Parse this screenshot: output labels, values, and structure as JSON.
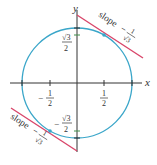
{
  "diagram": {
    "type": "unit circle with tangent lines",
    "axes": {
      "x_label": "x",
      "y_label": "y"
    },
    "ticks": {
      "x_neg": {
        "sign": "−",
        "num": "1",
        "den": "2"
      },
      "x_pos": {
        "num": "1",
        "den": "2"
      },
      "y_pos": {
        "num": "√3",
        "den": "2"
      },
      "y_neg": {
        "sign": "−",
        "num": "√3",
        "den": "2"
      }
    },
    "tangents": [
      {
        "label_word": "slope",
        "label_sign": "−",
        "label_num": "1",
        "label_den": "√3",
        "point": "(1/2, √3/2)"
      },
      {
        "label_word": "slope",
        "label_sign": "−",
        "label_num": "1",
        "label_den": "√3",
        "point": "(−1/2, −√3/2)"
      }
    ],
    "colors": {
      "circle": "#3aa6c9",
      "tangent": "#d9466a",
      "axis": "#333333",
      "tick_mark": "#3f8f4a"
    }
  }
}
